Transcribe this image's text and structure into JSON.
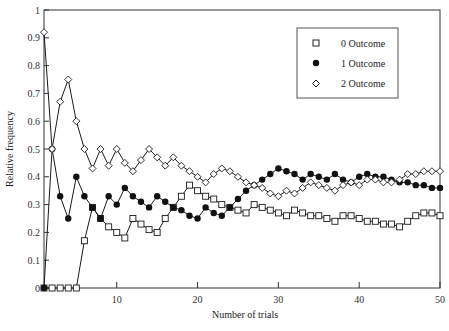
{
  "chart_data": {
    "type": "line",
    "title": "",
    "xlabel": "Number of trials",
    "ylabel": "Relative frequency",
    "xlim": [
      1,
      50
    ],
    "ylim": [
      0,
      1
    ],
    "xticks": [
      10,
      20,
      30,
      40,
      50
    ],
    "yticks": [
      0,
      0.1,
      0.2,
      0.3,
      0.4,
      0.5,
      0.6,
      0.7,
      0.8,
      0.9,
      1
    ],
    "ytick_labels": [
      "0",
      "0.1",
      "0.2",
      "0.3",
      "0.4",
      "0.5",
      "0.6",
      "0.7",
      "0.8",
      "0.9",
      "1"
    ],
    "xtick_labels": [
      "10",
      "20",
      "30",
      "40",
      "50"
    ],
    "grid": false,
    "legend_position": "upper right (inset box)",
    "x": [
      1,
      2,
      3,
      4,
      5,
      6,
      7,
      8,
      9,
      10,
      11,
      12,
      13,
      14,
      15,
      16,
      17,
      18,
      19,
      20,
      21,
      22,
      23,
      24,
      25,
      26,
      27,
      28,
      29,
      30,
      31,
      32,
      33,
      34,
      35,
      36,
      37,
      38,
      39,
      40,
      41,
      42,
      43,
      44,
      45,
      46,
      47,
      48,
      49,
      50
    ],
    "series": [
      {
        "name": "0 Outcome",
        "marker": "open-square",
        "values": [
          0,
          0,
          0,
          0,
          0,
          0.17,
          0.29,
          0.25,
          0.22,
          0.2,
          0.18,
          0.25,
          0.23,
          0.21,
          0.2,
          0.25,
          0.29,
          0.33,
          0.37,
          0.35,
          0.33,
          0.32,
          0.3,
          0.29,
          0.28,
          0.27,
          0.3,
          0.29,
          0.28,
          0.27,
          0.26,
          0.28,
          0.27,
          0.26,
          0.26,
          0.25,
          0.24,
          0.26,
          0.26,
          0.25,
          0.24,
          0.24,
          0.23,
          0.23,
          0.22,
          0.24,
          0.26,
          0.27,
          0.27,
          0.26
        ]
      },
      {
        "name": "1 Outcome",
        "marker": "filled-circle",
        "values": [
          0,
          0.5,
          0.33,
          0.25,
          0.4,
          0.33,
          0.29,
          0.25,
          0.33,
          0.3,
          0.36,
          0.33,
          0.31,
          0.29,
          0.33,
          0.31,
          0.29,
          0.28,
          0.26,
          0.25,
          0.29,
          0.27,
          0.26,
          0.29,
          0.32,
          0.35,
          0.37,
          0.39,
          0.41,
          0.43,
          0.42,
          0.41,
          0.39,
          0.41,
          0.4,
          0.39,
          0.41,
          0.39,
          0.38,
          0.4,
          0.41,
          0.4,
          0.4,
          0.39,
          0.38,
          0.38,
          0.37,
          0.37,
          0.36,
          0.36
        ]
      },
      {
        "name": "2 Outcome",
        "marker": "open-diamond",
        "values": [
          0.92,
          0.5,
          0.67,
          0.75,
          0.6,
          0.5,
          0.43,
          0.5,
          0.44,
          0.5,
          0.45,
          0.42,
          0.46,
          0.5,
          0.47,
          0.44,
          0.47,
          0.44,
          0.42,
          0.4,
          0.38,
          0.41,
          0.43,
          0.42,
          0.4,
          0.38,
          0.37,
          0.36,
          0.34,
          0.33,
          0.35,
          0.34,
          0.36,
          0.38,
          0.37,
          0.36,
          0.35,
          0.37,
          0.38,
          0.37,
          0.39,
          0.39,
          0.38,
          0.38,
          0.39,
          0.41,
          0.41,
          0.42,
          0.42,
          0.42
        ]
      }
    ]
  },
  "legend": {
    "items": [
      {
        "label": "0 Outcome",
        "marker": "open-square"
      },
      {
        "label": "1 Outcome",
        "marker": "filled-circle"
      },
      {
        "label": "2 Outcome",
        "marker": "open-diamond"
      }
    ]
  },
  "colors": {
    "line": "#1a1a1a",
    "axis": "#333333",
    "background": "#ffffff"
  }
}
